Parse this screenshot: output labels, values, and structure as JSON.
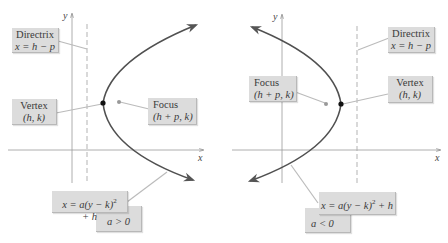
{
  "left_panel": {
    "axis_labels": {
      "x": "x",
      "y": "y"
    },
    "directrix": {
      "title": "Directrix",
      "formula": "x = h − p"
    },
    "vertex": {
      "title": "Vertex",
      "coords": "(h, k)"
    },
    "focus": {
      "title": "Focus",
      "coords": "(h + p, k)"
    },
    "equation": {
      "lhs": "x = a(y − k)",
      "exp": "2",
      "rhs": " + h"
    },
    "condition": "a > 0",
    "opens": "right"
  },
  "right_panel": {
    "axis_labels": {
      "x": "x",
      "y": "y"
    },
    "directrix": {
      "title": "Directrix",
      "formula": "x = h − p"
    },
    "vertex": {
      "title": "Vertex",
      "coords": "(h, k)"
    },
    "focus": {
      "title": "Focus",
      "coords": "(h + p, k)"
    },
    "equation": {
      "lhs": "x = a(y − k)",
      "exp": "2",
      "rhs": " + h"
    },
    "condition": "a < 0",
    "opens": "left"
  },
  "colors": {
    "curve": "#4a4a4a",
    "axis": "#8a8a8a",
    "label_box": "#dcdcdc",
    "vertex_dot": "#111111",
    "focus_dot": "#8a8a8a"
  }
}
